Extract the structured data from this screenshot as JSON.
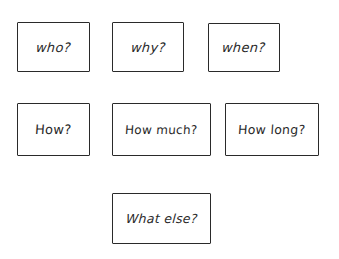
{
  "diagram": {
    "type": "question-word-cards",
    "rows": [
      {
        "cards": [
          {
            "label": "who?"
          },
          {
            "label": "why?"
          },
          {
            "label": "when?"
          }
        ]
      },
      {
        "cards": [
          {
            "label": "How?"
          },
          {
            "label": "How much?"
          },
          {
            "label": "How long?"
          }
        ]
      },
      {
        "cards": [
          {
            "label": "What else?"
          }
        ]
      }
    ],
    "colors": {
      "background": "#ffffff",
      "stroke": "#2a2a2a",
      "text": "#2a2a2a"
    }
  }
}
